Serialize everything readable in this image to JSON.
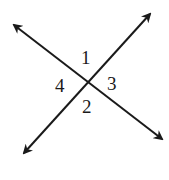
{
  "diagram": {
    "type": "intersecting-lines",
    "line_color": "#1a1a1a",
    "intersection": {
      "x": 88,
      "y": 83
    },
    "lines": [
      {
        "name": "line-a",
        "from": {
          "x": 14,
          "y": 25
        },
        "to": {
          "x": 162,
          "y": 139
        },
        "arrows": "both"
      },
      {
        "name": "line-b",
        "from": {
          "x": 24,
          "y": 153
        },
        "to": {
          "x": 150,
          "y": 14
        },
        "arrows": "both"
      }
    ],
    "angle_labels": [
      {
        "id": "1",
        "text": "1",
        "position": "top",
        "x": 81,
        "y": 48
      },
      {
        "id": "2",
        "text": "2",
        "position": "bottom",
        "x": 82,
        "y": 97
      },
      {
        "id": "3",
        "text": "3",
        "position": "right",
        "x": 107,
        "y": 74
      },
      {
        "id": "4",
        "text": "4",
        "position": "left",
        "x": 55,
        "y": 76
      }
    ]
  }
}
